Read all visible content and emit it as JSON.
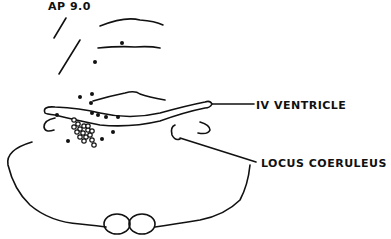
{
  "diagram": {
    "section_label": "AP 9.0",
    "labels": {
      "iv_ventricle": "IV VENTRICLE",
      "locus_coeruleus": "LOCUS COERULEUS"
    },
    "colors": {
      "ink": "#111111",
      "background": "#ffffff"
    },
    "markers": {
      "filled_dots": 14,
      "open_circles": 16
    }
  }
}
